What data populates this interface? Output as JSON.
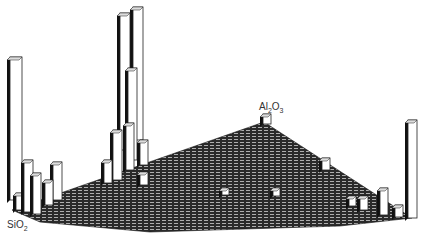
{
  "chart_data": {
    "type": "bar",
    "subtype": "3d-ternary-histogram",
    "title": "",
    "axes": {
      "corner_left": "SiO2",
      "corner_back": "Al2O3",
      "corner_right": ""
    },
    "labels": {
      "sio2": {
        "main": "SiO",
        "sub": "2"
      },
      "al2o3": {
        "main": "Al",
        "sub1": "2",
        "mid": "O",
        "sub2": "3"
      }
    },
    "grid": true,
    "bars": [
      {
        "name": "sio2-corner-tall",
        "x": 10,
        "top": 57,
        "base": 200,
        "w": 12,
        "relative_height": 0.55
      },
      {
        "name": "sio2-near-1",
        "x": 24,
        "top": 160,
        "base": 212,
        "w": 9,
        "relative_height": 0.2
      },
      {
        "name": "sio2-near-2",
        "x": 33,
        "top": 173,
        "base": 214,
        "w": 8,
        "relative_height": 0.16
      },
      {
        "name": "sio2-near-3",
        "x": 53,
        "top": 162,
        "base": 200,
        "w": 9,
        "relative_height": 0.15
      },
      {
        "name": "sio2-near-4",
        "x": 16,
        "top": 193,
        "base": 210,
        "w": 8,
        "relative_height": 0.07
      },
      {
        "name": "sio2-near-5",
        "x": 45,
        "top": 180,
        "base": 205,
        "w": 8,
        "relative_height": 0.09
      },
      {
        "name": "center-tall-1",
        "x": 120,
        "top": 13,
        "base": 150,
        "w": 10,
        "relative_height": 0.9
      },
      {
        "name": "center-tall-2",
        "x": 133,
        "top": 7,
        "base": 140,
        "w": 10,
        "relative_height": 1.0
      },
      {
        "name": "center-mid-1",
        "x": 128,
        "top": 68,
        "base": 160,
        "w": 9,
        "relative_height": 0.55
      },
      {
        "name": "center-mid-2",
        "x": 113,
        "top": 130,
        "base": 180,
        "w": 9,
        "relative_height": 0.27
      },
      {
        "name": "center-mid-3",
        "x": 126,
        "top": 123,
        "base": 170,
        "w": 8,
        "relative_height": 0.24
      },
      {
        "name": "center-mid-4",
        "x": 104,
        "top": 160,
        "base": 183,
        "w": 8,
        "relative_height": 0.1
      },
      {
        "name": "center-low-1",
        "x": 140,
        "top": 140,
        "base": 165,
        "w": 8,
        "relative_height": 0.1
      },
      {
        "name": "center-low-2",
        "x": 140,
        "top": 172,
        "base": 185,
        "w": 8,
        "relative_height": 0.05
      },
      {
        "name": "al2o3-corner",
        "x": 263,
        "top": 114,
        "base": 124,
        "w": 8,
        "relative_height": 0.04
      },
      {
        "name": "mid-slope-1",
        "x": 322,
        "top": 158,
        "base": 170,
        "w": 8,
        "relative_height": 0.05
      },
      {
        "name": "mid-surface-1",
        "x": 273,
        "top": 188,
        "base": 196,
        "w": 7,
        "relative_height": 0.03
      },
      {
        "name": "mid-surface-2",
        "x": 222,
        "top": 188,
        "base": 195,
        "w": 7,
        "relative_height": 0.03
      },
      {
        "name": "right-corner-tall",
        "x": 408,
        "top": 120,
        "base": 218,
        "w": 9,
        "relative_height": 0.5
      },
      {
        "name": "right-near-1",
        "x": 380,
        "top": 188,
        "base": 215,
        "w": 8,
        "relative_height": 0.12
      },
      {
        "name": "right-near-2",
        "x": 360,
        "top": 196,
        "base": 210,
        "w": 8,
        "relative_height": 0.06
      },
      {
        "name": "right-near-3",
        "x": 349,
        "top": 196,
        "base": 206,
        "w": 7,
        "relative_height": 0.04
      },
      {
        "name": "right-near-4",
        "x": 395,
        "top": 205,
        "base": 217,
        "w": 8,
        "relative_height": 0.05
      }
    ]
  }
}
